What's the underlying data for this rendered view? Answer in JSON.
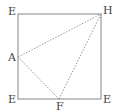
{
  "diagram": {
    "type": "geometry",
    "square": {
      "corners": [
        "top-left",
        "top-right",
        "bottom-right",
        "bottom-left"
      ]
    },
    "labels": {
      "top_left": "E",
      "top_right": "H",
      "bottom_left": "E",
      "bottom_right": "E",
      "left_point": "A",
      "bottom_point": "F"
    },
    "dotted_segments": [
      "A-H",
      "A-F",
      "F-H"
    ],
    "colors": {
      "square": "#9a9a9a",
      "dotted": "#8a8a8a",
      "text": "#444444"
    }
  }
}
